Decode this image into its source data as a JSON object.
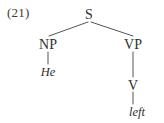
{
  "figure": {
    "example_number": "(21)",
    "type": "syntax-tree",
    "ink_color": "#2f2f2f",
    "background_color": "#ffffff"
  },
  "tree": {
    "root": {
      "label": "S",
      "x": 89,
      "y": 14
    },
    "nodes": [
      {
        "id": "np",
        "label": "NP",
        "x": 48,
        "y": 44,
        "parent": "s",
        "italic": false
      },
      {
        "id": "vp",
        "label": "VP",
        "x": 133,
        "y": 44,
        "parent": "s",
        "italic": false
      },
      {
        "id": "v",
        "label": "V",
        "x": 133,
        "y": 85,
        "parent": "vp",
        "italic": false
      }
    ],
    "terminals": [
      {
        "id": "he",
        "label": "He",
        "x": 48,
        "y": 72,
        "parent": "np",
        "italic": true
      },
      {
        "id": "left",
        "label": "left",
        "x": 137,
        "y": 112,
        "parent": "v",
        "italic": true
      }
    ],
    "edges": [
      {
        "from": "s",
        "to": "np",
        "kind": "diagonal",
        "x1": 88,
        "y1": 22,
        "x2": 49,
        "y2": 36
      },
      {
        "from": "s",
        "to": "vp",
        "kind": "diagonal",
        "x1": 91,
        "y1": 22,
        "x2": 133,
        "y2": 36
      },
      {
        "from": "np",
        "to": "he",
        "kind": "vertical",
        "x1": 48,
        "y1": 52,
        "x2": 48,
        "y2": 64
      },
      {
        "from": "vp",
        "to": "v",
        "kind": "vertical",
        "x1": 133,
        "y1": 52,
        "x2": 133,
        "y2": 77
      },
      {
        "from": "v",
        "to": "left",
        "kind": "vertical",
        "x1": 133,
        "y1": 92,
        "x2": 133,
        "y2": 104
      }
    ]
  }
}
